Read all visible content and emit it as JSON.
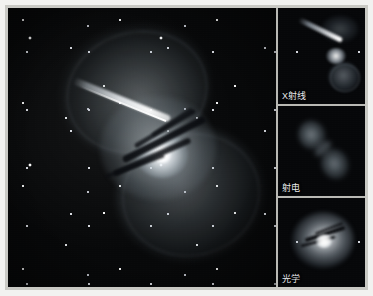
{
  "figure": {
    "layout": "one large composite panel at left with three stacked single-band panels at right",
    "background_color": "#f2f2f0",
    "frame_color": "#c9c9c4",
    "sky_color": "#060709"
  },
  "main_panel": {
    "name": "composite-image",
    "features": [
      "bright galactic nucleus",
      "dark dust lane",
      "relativistic jet toward upper left",
      "two diffuse radio lobes",
      "dense background starfield"
    ]
  },
  "side_panels": [
    {
      "id": "xray",
      "label": "X射线",
      "features": [
        "inner jet",
        "bright core",
        "southern lobe"
      ]
    },
    {
      "id": "radio",
      "label": "射电",
      "features": [
        "northern lobe",
        "southern lobe",
        "connecting bridge"
      ]
    },
    {
      "id": "optical",
      "label": "光学",
      "features": [
        "elliptical halo",
        "bright core",
        "dust lane"
      ]
    }
  ],
  "colors": {
    "label_text": "#e8e9ec",
    "divider": "#b9b9b4",
    "plate": "#c9c9c4",
    "sky": "#060709"
  }
}
